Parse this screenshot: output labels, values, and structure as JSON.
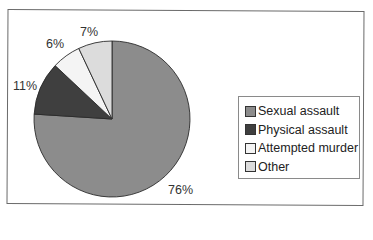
{
  "chart_data": {
    "type": "pie",
    "title": "",
    "start_angle": "12 o'clock, clockwise",
    "categories": [
      "Sexual assault",
      "Physical assault",
      "Attempted murder",
      "Other"
    ],
    "values": [
      76,
      11,
      6,
      7
    ],
    "unit": "%",
    "data_labels": [
      "76%",
      "11%",
      "6%",
      "7%"
    ],
    "colors": [
      "#8c8c8c",
      "#3f3f3f",
      "#f4f4f4",
      "#dcdcdc"
    ],
    "legend_position": "right",
    "legend": [
      "Sexual assault",
      "Physical assault",
      "Attempted murder",
      "Other"
    ]
  },
  "labels": {
    "sexual": "76%",
    "physical": "11%",
    "attempted": "6%",
    "other": "7%"
  },
  "legend": {
    "items": [
      {
        "label": "Sexual assault",
        "color": "#8c8c8c"
      },
      {
        "label": "Physical assault",
        "color": "#3f3f3f"
      },
      {
        "label": "Attempted murder",
        "color": "#f4f4f4"
      },
      {
        "label": "Other",
        "color": "#dcdcdc"
      }
    ]
  }
}
